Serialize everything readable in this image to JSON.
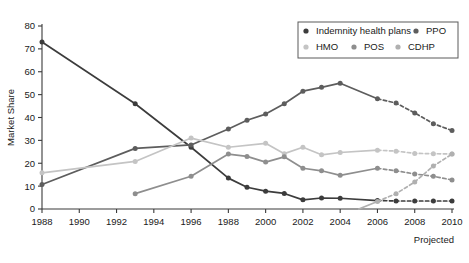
{
  "chart_data": {
    "type": "line",
    "title": "",
    "xlabel": "",
    "ylabel": "Market Share",
    "xlim": [
      1988,
      2010
    ],
    "ylim": [
      0,
      80
    ],
    "grid": false,
    "legend_position": "top-right",
    "x_tick_labels": [
      "1988",
      "1990",
      "1992",
      "1994",
      "1996",
      "1988",
      "2000",
      "2002",
      "2004",
      "2006",
      "2008",
      "2010"
    ],
    "x_tick_values": [
      1988,
      1990,
      1992,
      1994,
      1996,
      1998,
      2000,
      2002,
      2004,
      2006,
      2008,
      2010
    ],
    "y_tick_labels": [
      "0",
      "10",
      "20",
      "30",
      "40",
      "50",
      "60",
      "70",
      "80"
    ],
    "y_tick_values": [
      0,
      10,
      20,
      30,
      40,
      50,
      60,
      70,
      80
    ],
    "annotations": [
      {
        "text": "Projected",
        "position": "below-axis-right"
      }
    ],
    "series": [
      {
        "name": "Indemnity health plans",
        "color": "#3c3c3c",
        "x": [
          1988,
          1993,
          1996,
          1998,
          1999,
          2000,
          2001,
          2002,
          2003,
          2004,
          2006,
          2007,
          2008,
          2009,
          2010
        ],
        "values": [
          73,
          46,
          27,
          13.5,
          9.5,
          7.8,
          6.8,
          4,
          4.8,
          4.7,
          3.7,
          3.5,
          3.5,
          3.5,
          3.5
        ],
        "projected_from": 2006
      },
      {
        "name": "PPO",
        "color": "#5d5d5d",
        "x": [
          1988,
          1993,
          1996,
          1998,
          1999,
          2000,
          2001,
          2002,
          2003,
          2004,
          2006,
          2007,
          2008,
          2009,
          2010
        ],
        "values": [
          10.7,
          26.5,
          28,
          35,
          38.8,
          41.5,
          46,
          51.5,
          53.2,
          55,
          48.2,
          46.3,
          42,
          37.3,
          34.3
        ],
        "projected_from": 2006
      },
      {
        "name": "HMO",
        "color": "#c4c4c4",
        "x": [
          1988,
          1993,
          1996,
          1998,
          2000,
          2001,
          2002,
          2003,
          2004,
          2006,
          2007,
          2008,
          2009,
          2010
        ],
        "values": [
          15.8,
          20.8,
          31,
          27,
          28.7,
          24.2,
          27,
          23.7,
          24.7,
          25.7,
          25.3,
          24.3,
          24.2,
          24
        ],
        "projected_from": 2006
      },
      {
        "name": "POS",
        "color": "#8e8e8e",
        "x": [
          1993,
          1996,
          1998,
          1999,
          2000,
          2001,
          2002,
          2003,
          2004,
          2006,
          2007,
          2008,
          2009,
          2010
        ],
        "values": [
          6.7,
          14.3,
          24,
          23,
          20.5,
          22.8,
          17.8,
          16.7,
          14.7,
          17.8,
          16.7,
          15.3,
          14.3,
          12.7
        ],
        "projected_from": 2006
      },
      {
        "name": "CDHP",
        "color": "#b0b0b0",
        "x": [
          2005,
          2006,
          2007,
          2008,
          2009,
          2010
        ],
        "values": [
          0,
          3.3,
          6.7,
          11.8,
          18.8,
          24
        ],
        "projected_from": 2006
      }
    ]
  },
  "legend": {
    "entries": [
      {
        "label": "Indemnity health plans",
        "color": "#3c3c3c"
      },
      {
        "label": "PPO",
        "color": "#5d5d5d"
      },
      {
        "label": "HMO",
        "color": "#c4c4c4"
      },
      {
        "label": "POS",
        "color": "#8e8e8e"
      },
      {
        "label": "CDHP",
        "color": "#b0b0b0"
      }
    ]
  }
}
